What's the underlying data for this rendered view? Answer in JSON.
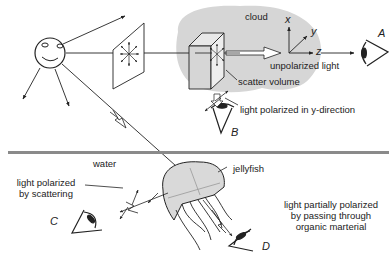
{
  "diagram": {
    "colors": {
      "line": "#222222",
      "cloud": "#d6d6d6",
      "water_surface": "#8a8a8a",
      "jellyfish": "#d9d9d9",
      "background": "#ffffff"
    },
    "labels": {
      "cloud": "cloud",
      "axis_x": "x",
      "axis_y": "y",
      "axis_z": "z",
      "observer_a": "A",
      "observer_b": "B",
      "observer_c": "C",
      "observer_d": "D",
      "unpolarized_light": "unpolarized light",
      "scatter_volume": "scatter volume",
      "polarized_y": "light polarized in y-direction",
      "water": "water",
      "jellyfish": "jellyfish",
      "polarized_scattering_line1": "light polarized",
      "polarized_scattering_line2": "by scattering",
      "partial_line1": "light partially polarized",
      "partial_line2": "by passing through",
      "partial_line3": "organic  marterial"
    },
    "elements": [
      "sun",
      "polarization-filter-plane",
      "cloud",
      "scatter-volume",
      "axes",
      "eye-A",
      "eye-B",
      "eye-C",
      "eye-D",
      "water-surface",
      "jellyfish"
    ]
  }
}
